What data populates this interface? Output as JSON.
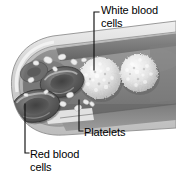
{
  "figure": {
    "background_color": "#ffffff",
    "width": 176,
    "height": 181
  },
  "labels": {
    "white_blood_cells": "White blood\ncells",
    "platelets": "Platelets",
    "red_blood_cells": "Red blood\ncells"
  },
  "colors": {
    "outer_wall": "#d8d8d8",
    "outer_wall_edge": "#9a9a9a",
    "inner_wall": "#b4b4b4",
    "lumen": "#8a8a8a",
    "lumen_shadow": "#6f6f6f",
    "wall_band_dark": "#707070",
    "wall_band_mid": "#8d8d8d",
    "wall_highlight": "#e6e6e6",
    "red_blood_cell": "#5a5a5a",
    "red_blood_cell_rim": "#777777",
    "red_blood_cell_center": "#4a4a4a",
    "white_blood_cell": "#e9e9e9",
    "white_blood_cell_shade": "#c4c4c4",
    "platelet": "#ececec",
    "leader_line": "#1a1a1a",
    "text": "#000000"
  },
  "structures": {
    "red_blood_cells_count": 3,
    "white_blood_cells_count": 2,
    "platelets_count": 14
  },
  "leaders": {
    "white_blood_cells": "elbow from label left down into upper white blood cell",
    "platelets": "elbow from label left up into platelet cluster on lower wall",
    "red_blood_cells": "elbow from label left up into lower red blood cell"
  }
}
